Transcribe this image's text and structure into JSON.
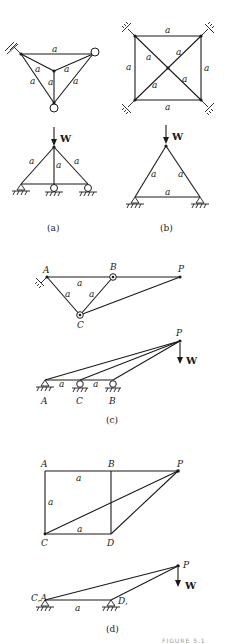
{
  "figure": {
    "panels": [
      {
        "id": "a",
        "caption": "(a)",
        "member_label": "a",
        "load_label": "W"
      },
      {
        "id": "b",
        "caption": "(b)",
        "member_label": "a",
        "load_label": "W"
      },
      {
        "id": "c",
        "caption": "(c)",
        "member_label": "a",
        "load_label": "W",
        "nodes": {
          "A": "A",
          "B": "B",
          "C": "C",
          "P": "P"
        }
      },
      {
        "id": "d",
        "caption": "(d)",
        "member_label": "a",
        "load_label": "W",
        "nodes": {
          "A": "A",
          "B": "B",
          "C": "C",
          "D": "D",
          "P": "P",
          "CA": "C,A",
          "D2": "D,"
        }
      }
    ],
    "footer_text": "FIGURE 5.1"
  }
}
